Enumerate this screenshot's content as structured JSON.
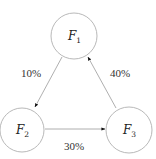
{
  "diagram": {
    "type": "directed-cycle",
    "colors": {
      "node_stroke": "#b0b0b0",
      "edge_stroke": "#9a9a9a",
      "arrowhead": "#111111",
      "text": "#222222"
    },
    "nodes": [
      {
        "id": "F1",
        "symbol": "F",
        "subscript": "1",
        "cx": 74,
        "cy": 36,
        "r": 23
      },
      {
        "id": "F2",
        "symbol": "F",
        "subscript": "2",
        "cx": 22,
        "cy": 130,
        "r": 22
      },
      {
        "id": "F3",
        "symbol": "F",
        "subscript": "3",
        "cx": 129,
        "cy": 130,
        "r": 23
      }
    ],
    "edges": [
      {
        "from": "F1",
        "to": "F2",
        "label": "10%"
      },
      {
        "from": "F2",
        "to": "F3",
        "label": "30%"
      },
      {
        "from": "F3",
        "to": "F1",
        "label": "40%"
      }
    ]
  }
}
